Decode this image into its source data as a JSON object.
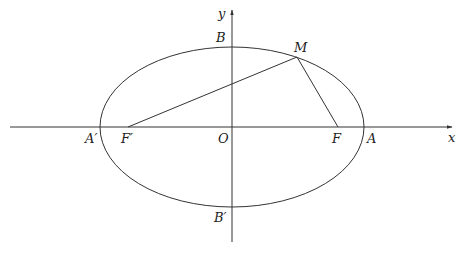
{
  "diagram": {
    "type": "ellipse-foci",
    "axes": {
      "x_label": "x",
      "y_label": "y"
    },
    "points": {
      "origin": "O",
      "right_vertex": "A",
      "left_vertex": "A′",
      "top_vertex": "B",
      "bottom_vertex": "B′",
      "right_focus": "F",
      "left_focus": "F′",
      "point_on_ellipse": "M"
    },
    "segments": [
      "MF′",
      "MF"
    ],
    "colors": {
      "stroke": "#333333",
      "background": "#ffffff"
    }
  }
}
